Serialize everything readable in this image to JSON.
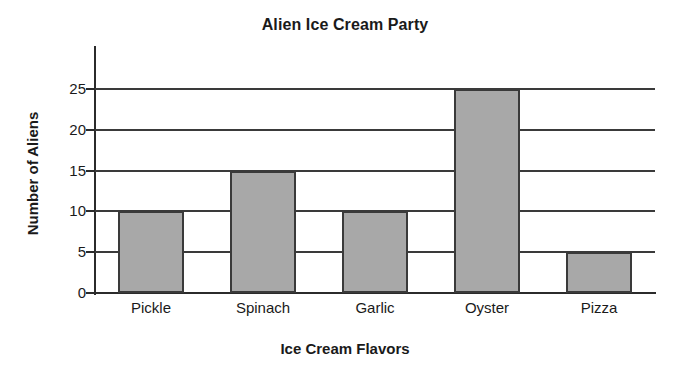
{
  "chart_data": {
    "type": "bar",
    "title": "Alien Ice Cream Party",
    "xlabel": "Ice Cream Flavors",
    "ylabel": "Number of Aliens",
    "categories": [
      "Pickle",
      "Spinach",
      "Garlic",
      "Oyster",
      "Pizza"
    ],
    "values": [
      10,
      15,
      10,
      25,
      5
    ],
    "ylim": [
      0,
      25
    ],
    "yticks": [
      0,
      5,
      10,
      15,
      20,
      25
    ],
    "ytick_labels": [
      "0",
      "5",
      "10",
      "15",
      "20",
      "25"
    ],
    "grid": true,
    "grid_axis": "y",
    "legend": "none",
    "bar_color": "#a8a8a8",
    "bar_edge_color": "#3a3a3a",
    "axis_color": "#2b2b2b",
    "background_color": "#ffffff"
  }
}
